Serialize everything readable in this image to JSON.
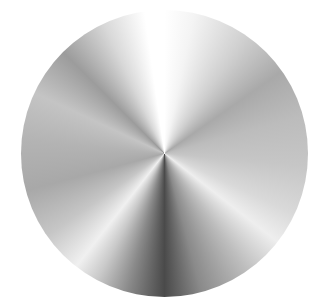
{
  "image": {
    "subject": "brushed metal conic gradient disc",
    "colors": {
      "background": "#ffffff",
      "highlight": "#ffffff",
      "shadow": "#4a4a4a",
      "midtone": "#b0b0b0"
    }
  }
}
